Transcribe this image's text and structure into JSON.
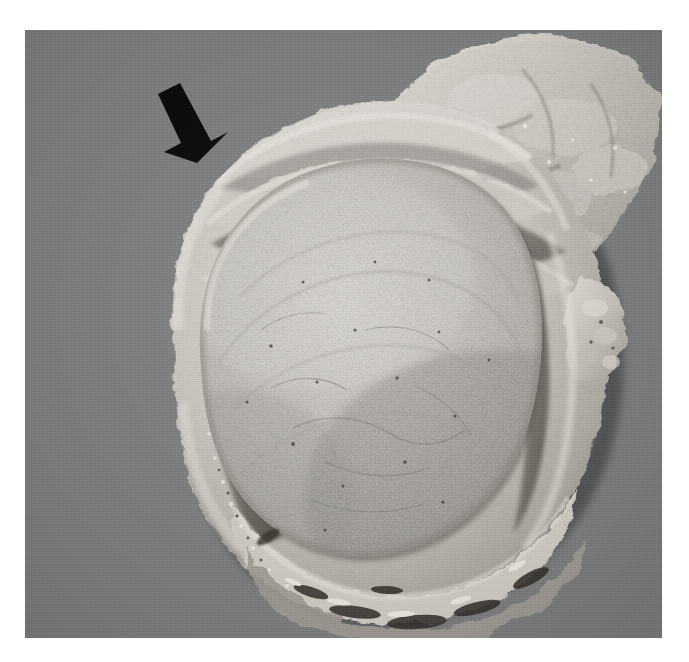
{
  "figure": {
    "kind": "gross-pathology-photograph",
    "modality": "macroscopic color photograph (greyscale reproduction)",
    "orientation": "cut/bisected surface facing the viewer",
    "background_color": "#808080",
    "page_margin_color": "#ffffff",
    "specimen": {
      "organ": "uterus",
      "description": "Bisected uterus containing a single large, well-circumscribed intramural mass that bulges from the cut surface and compresses the surrounding myometrium into a thin rim.",
      "diagnosis_implied": "leiomyoma (fibroid)",
      "cut_surface_texture": "homogeneous, finely granular, whorled, bulging",
      "tissue_tone_light": "#d8d4cc",
      "tissue_tone_mid": "#b9b5ad",
      "tissue_tone_dark": "#6e6a64"
    },
    "annotations": [
      {
        "name": "pointer-arrow",
        "glyph": "solid black arrow",
        "color": "#0a0a0a",
        "direction": "down-right",
        "tail_x": 158,
        "tail_y": 94,
        "tip_x": 197,
        "tip_y": 157,
        "points_at": "interface between the compressed myometrial rim and the capsule of the tumour"
      }
    ],
    "regions": [
      {
        "name": "compressed-myometrium-rim",
        "position": "outer crescent, left / lower border of the specimen"
      },
      {
        "name": "tumour-mass",
        "position": "centre, large ovoid bulging nodule"
      },
      {
        "name": "cleft-plane",
        "position": "dark slit separating tumour capsule from myometrium, upper-left and lower-left"
      },
      {
        "name": "adnexal-adipose-tissue",
        "position": "upper-right, shaggy irregular attached soft tissue"
      },
      {
        "name": "serosal-surface",
        "position": "outer convex border, lower edge shows darker haemorrhagic roughening"
      },
      {
        "name": "nodular-projection",
        "position": "right lateral border, small knobbly excrescence"
      }
    ],
    "visible_text": []
  }
}
